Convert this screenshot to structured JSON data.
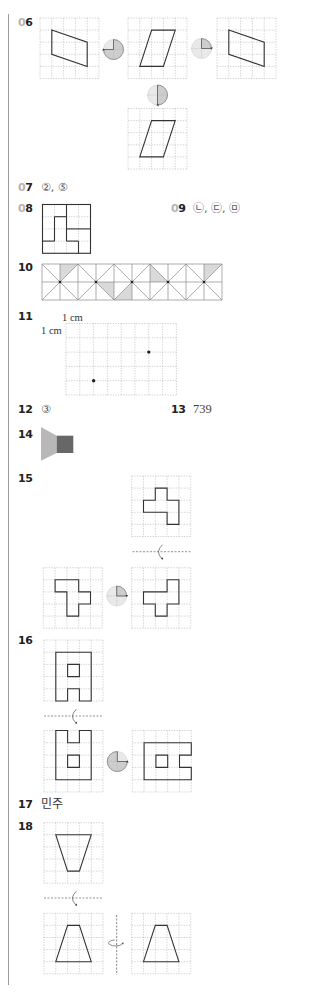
{
  "questions": {
    "q06": {
      "prefix": "0",
      "num": "6"
    },
    "q07": {
      "prefix": "0",
      "num": "7",
      "answer": "②, ⑤"
    },
    "q08": {
      "prefix": "0",
      "num": "8"
    },
    "q09": {
      "prefix": "0",
      "num": "9",
      "answer": "㉡, ㉢, ㉤"
    },
    "q10": {
      "label": "10"
    },
    "q11": {
      "label": "11",
      "unit_top": "1 cm",
      "unit_left": "1 cm"
    },
    "q12": {
      "label": "12",
      "answer": "③"
    },
    "q13": {
      "label": "13",
      "answer": "739"
    },
    "q14": {
      "label": "14"
    },
    "q15": {
      "label": "15"
    },
    "q16": {
      "label": "16"
    },
    "q17": {
      "label": "17",
      "answer": "민주"
    },
    "q18": {
      "label": "18"
    }
  },
  "colors": {
    "outline": "#333333",
    "grid_dashed": "#b3b3b3",
    "grid_solid": "#8a8a8a",
    "shade": "#d9d9d9",
    "icon_fill": "#e9e9e9",
    "icon_sector": "#cdcdcd",
    "shape_light": "#b8b8b8",
    "shape_dark": "#676767"
  },
  "figures": [
    {
      "name": "q06-figure-original",
      "type": "grid",
      "x": 40,
      "y": 18,
      "cols": 5,
      "rows": 5,
      "cw": 11.8,
      "ch": 12.1,
      "grid_style": "dashed",
      "polygons": [
        [
          [
            1,
            1
          ],
          [
            4,
            2
          ],
          [
            4,
            4
          ],
          [
            1,
            3
          ]
        ]
      ]
    },
    {
      "name": "q06-rotate-270-icon",
      "type": "rot-icon",
      "cx": 113.5,
      "cy": 49.5,
      "r": 10,
      "from": 0,
      "to": 270,
      "arrow_at": 270,
      "ccw": false
    },
    {
      "name": "q06-figure-rotated-a",
      "type": "grid",
      "x": 128,
      "y": 18,
      "cols": 5,
      "rows": 5,
      "cw": 11.8,
      "ch": 12.1,
      "grid_style": "dashed",
      "polygons": [
        [
          [
            2,
            1
          ],
          [
            4,
            1
          ],
          [
            3,
            4
          ],
          [
            1,
            4
          ]
        ]
      ]
    },
    {
      "name": "q06-rotate-90-icon",
      "type": "rot-icon",
      "cx": 201.5,
      "cy": 48.5,
      "r": 10,
      "from": 0,
      "to": 90,
      "arrow_at": 90,
      "ccw": false
    },
    {
      "name": "q06-figure-rotated-b",
      "type": "grid",
      "x": 217,
      "y": 18,
      "cols": 5,
      "rows": 5,
      "cw": 11.8,
      "ch": 12.1,
      "grid_style": "dashed",
      "polygons": [
        [
          [
            1,
            1
          ],
          [
            4,
            2
          ],
          [
            4,
            4
          ],
          [
            1,
            3
          ]
        ]
      ]
    },
    {
      "name": "q06-rotate-180-icon",
      "type": "rot-icon",
      "cx": 157.5,
      "cy": 95,
      "r": 10,
      "from": 0,
      "to": 180,
      "arrow_at": 180,
      "ccw": false
    },
    {
      "name": "q06-figure-rotated-c",
      "type": "grid",
      "x": 128,
      "y": 108.5,
      "cols": 5,
      "rows": 5,
      "cw": 11.8,
      "ch": 12.1,
      "grid_style": "dashed",
      "polygons": [
        [
          [
            2,
            1
          ],
          [
            4,
            1
          ],
          [
            3,
            4
          ],
          [
            1,
            4
          ]
        ]
      ]
    },
    {
      "name": "q08-square-puzzle",
      "type": "grid",
      "x": 42.5,
      "y": 204.5,
      "cols": 4,
      "rows": 4,
      "cw": 12,
      "ch": 12.2,
      "grid_style": "dashed",
      "border": true,
      "lines": [
        [
          2,
          0,
          2,
          3
        ],
        [
          2,
          2,
          4,
          2
        ],
        [
          2,
          3,
          3,
          3
        ],
        [
          3,
          3,
          3,
          4
        ],
        [
          1,
          1,
          2,
          1
        ],
        [
          1,
          1,
          1,
          3
        ],
        [
          0,
          3,
          1,
          3
        ]
      ]
    },
    {
      "name": "q10-triangle-pattern",
      "type": "grid",
      "x": 42,
      "y": 264,
      "cols": 10,
      "rows": 2,
      "cw": 18,
      "ch": 18,
      "grid_style": "solid",
      "shaded": [
        [
          [
            1,
            0
          ],
          [
            2,
            0
          ],
          [
            1,
            1
          ]
        ],
        [
          [
            3,
            1
          ],
          [
            4,
            1
          ],
          [
            4,
            2
          ]
        ],
        [
          [
            5,
            1
          ],
          [
            5,
            2
          ],
          [
            4,
            2
          ]
        ],
        [
          [
            6,
            0
          ],
          [
            6,
            1
          ],
          [
            7,
            1
          ]
        ],
        [
          [
            9,
            0
          ],
          [
            10,
            0
          ],
          [
            9,
            1
          ]
        ]
      ],
      "diagonals": [
        [
          0,
          0,
          1,
          1
        ],
        [
          1,
          1,
          2,
          0
        ],
        [
          1,
          1,
          0,
          2
        ],
        [
          1,
          1,
          2,
          2
        ],
        [
          2,
          0,
          3,
          1
        ],
        [
          3,
          1,
          4,
          0
        ],
        [
          3,
          1,
          2,
          2
        ],
        [
          3,
          1,
          4,
          2
        ],
        [
          4,
          0,
          5,
          1
        ],
        [
          5,
          1,
          6,
          0
        ],
        [
          5,
          1,
          4,
          2
        ],
        [
          5,
          1,
          6,
          2
        ],
        [
          6,
          0,
          7,
          1
        ],
        [
          7,
          1,
          8,
          0
        ],
        [
          7,
          1,
          6,
          2
        ],
        [
          7,
          1,
          8,
          2
        ],
        [
          8,
          0,
          9,
          1
        ],
        [
          9,
          1,
          10,
          0
        ],
        [
          9,
          1,
          8,
          2
        ],
        [
          9,
          1,
          10,
          2
        ]
      ],
      "dots": [
        [
          1,
          1
        ],
        [
          3,
          1
        ],
        [
          5,
          1
        ],
        [
          7,
          1
        ],
        [
          9,
          1
        ]
      ],
      "dot_r": 1.3
    },
    {
      "name": "q11-dot-grid",
      "type": "grid",
      "x": 66,
      "y": 323.5,
      "cols": 8,
      "rows": 5,
      "cw": 13.8,
      "ch": 14.3,
      "grid_style": "dashed",
      "dots": [
        [
          2,
          4
        ],
        [
          6,
          2
        ]
      ],
      "dot_r": 1.7
    },
    {
      "name": "q14-shape",
      "type": "shapes",
      "polys": [
        {
          "points": [
            [
              41,
              427
            ],
            [
              56.7,
              435.7
            ],
            [
              56.7,
              453
            ],
            [
              41,
              460.7
            ]
          ],
          "color": "shape_light"
        },
        {
          "points": [
            [
              56.7,
              435.7
            ],
            [
              73.3,
              435.7
            ],
            [
              73.3,
              453
            ],
            [
              56.7,
              453
            ]
          ],
          "color": "shape_dark"
        }
      ]
    },
    {
      "name": "q15-figure-top",
      "type": "grid",
      "x": 131.7,
      "y": 476,
      "cols": 5,
      "rows": 5,
      "cw": 11.8,
      "ch": 12.1,
      "grid_style": "dashed",
      "polygons": [
        [
          [
            2,
            1
          ],
          [
            3,
            1
          ],
          [
            3,
            2
          ],
          [
            4,
            2
          ],
          [
            4,
            4
          ],
          [
            3,
            4
          ],
          [
            3,
            3
          ],
          [
            1,
            3
          ],
          [
            1,
            2
          ],
          [
            2,
            2
          ]
        ]
      ]
    },
    {
      "name": "q15-flip-marker",
      "type": "flip-h",
      "x1": 132.5,
      "x2": 190.5,
      "y": 551.7,
      "ax": 160
    },
    {
      "name": "q15-figure-left",
      "type": "grid",
      "x": 43.3,
      "y": 567.7,
      "cols": 5,
      "rows": 5,
      "cw": 11.8,
      "ch": 12.1,
      "grid_style": "dashed",
      "polygons": [
        [
          [
            1,
            1
          ],
          [
            3,
            1
          ],
          [
            3,
            2
          ],
          [
            4,
            2
          ],
          [
            4,
            3
          ],
          [
            3,
            3
          ],
          [
            3,
            4
          ],
          [
            2,
            4
          ],
          [
            2,
            2
          ],
          [
            1,
            2
          ]
        ]
      ]
    },
    {
      "name": "q15-rotate-90-icon",
      "type": "rot-icon",
      "cx": 116.7,
      "cy": 596,
      "r": 10,
      "from": 0,
      "to": 90,
      "arrow_at": 90,
      "ccw": false
    },
    {
      "name": "q15-figure-right",
      "type": "grid",
      "x": 131.7,
      "y": 567.7,
      "cols": 5,
      "rows": 5,
      "cw": 11.8,
      "ch": 12.1,
      "grid_style": "dashed",
      "polygons": [
        [
          [
            1,
            2
          ],
          [
            3,
            2
          ],
          [
            3,
            1
          ],
          [
            4,
            1
          ],
          [
            4,
            3
          ],
          [
            3,
            3
          ],
          [
            3,
            4
          ],
          [
            2,
            4
          ],
          [
            2,
            3
          ],
          [
            1,
            3
          ]
        ]
      ]
    },
    {
      "name": "q16-figure-top",
      "type": "grid",
      "x": 44,
      "y": 640,
      "cols": 5,
      "rows": 5,
      "cw": 11.8,
      "ch": 12.2,
      "grid_style": "dashed",
      "polygons": [
        [
          [
            1,
            1
          ],
          [
            4,
            1
          ],
          [
            4,
            5
          ],
          [
            3,
            5
          ],
          [
            3,
            4
          ],
          [
            2,
            4
          ],
          [
            2,
            5
          ],
          [
            1,
            5
          ]
        ],
        [
          [
            2,
            2
          ],
          [
            3,
            2
          ],
          [
            3,
            3
          ],
          [
            2,
            3
          ]
        ]
      ]
    },
    {
      "name": "q16-flip-marker",
      "type": "flip-h",
      "x1": 44,
      "x2": 103,
      "y": 716,
      "ax": 74
    },
    {
      "name": "q16-figure-left",
      "type": "grid",
      "x": 44,
      "y": 730.5,
      "cols": 5,
      "rows": 5,
      "cw": 11.8,
      "ch": 12.3,
      "grid_style": "dashed",
      "polygons": [
        [
          [
            1,
            0
          ],
          [
            2,
            0
          ],
          [
            2,
            1
          ],
          [
            3,
            1
          ],
          [
            3,
            0
          ],
          [
            4,
            0
          ],
          [
            4,
            4
          ],
          [
            1,
            4
          ]
        ],
        [
          [
            2,
            2
          ],
          [
            3,
            2
          ],
          [
            3,
            3
          ],
          [
            2,
            3
          ]
        ]
      ]
    },
    {
      "name": "q16-rotate-270-icon",
      "type": "rot-icon",
      "cx": 117.3,
      "cy": 761.5,
      "r": 10,
      "from": 90,
      "to": 360,
      "arrow_at": 90,
      "ccw": true
    },
    {
      "name": "q16-figure-right",
      "type": "grid",
      "x": 132.3,
      "y": 730.5,
      "cols": 5,
      "rows": 5,
      "cw": 11.8,
      "ch": 12.3,
      "grid_style": "dashed",
      "polygons": [
        [
          [
            1,
            1
          ],
          [
            5,
            1
          ],
          [
            5,
            2
          ],
          [
            4,
            2
          ],
          [
            4,
            3
          ],
          [
            5,
            3
          ],
          [
            5,
            4
          ],
          [
            1,
            4
          ]
        ],
        [
          [
            2,
            2
          ],
          [
            3,
            2
          ],
          [
            3,
            3
          ],
          [
            2,
            3
          ]
        ]
      ]
    },
    {
      "name": "q18-figure-top",
      "type": "grid",
      "x": 44,
      "y": 822.7,
      "cols": 5,
      "rows": 5,
      "cw": 11.8,
      "ch": 12.1,
      "grid_style": "dashed",
      "polygons": [
        [
          [
            1,
            1
          ],
          [
            4,
            1
          ],
          [
            3,
            4
          ],
          [
            2,
            4
          ]
        ]
      ]
    },
    {
      "name": "q18-flip-marker",
      "type": "flip-h",
      "x1": 44,
      "x2": 103,
      "y": 898,
      "ax": 74
    },
    {
      "name": "q18-figure-left",
      "type": "grid",
      "x": 44,
      "y": 913.3,
      "cols": 5,
      "rows": 5,
      "cw": 11.8,
      "ch": 12.1,
      "grid_style": "dashed",
      "polygons": [
        [
          [
            2,
            1
          ],
          [
            3,
            1
          ],
          [
            4,
            4
          ],
          [
            1,
            4
          ]
        ]
      ]
    },
    {
      "name": "q18-vertical-flip-marker",
      "type": "flip-v",
      "x": 116.7,
      "y1": 915,
      "y2": 975,
      "ay": 943
    },
    {
      "name": "q18-figure-right",
      "type": "grid",
      "x": 131.7,
      "y": 913.3,
      "cols": 5,
      "rows": 5,
      "cw": 11.8,
      "ch": 12.1,
      "grid_style": "dashed",
      "polygons": [
        [
          [
            2,
            1
          ],
          [
            3,
            1
          ],
          [
            4,
            4
          ],
          [
            1,
            4
          ]
        ]
      ]
    }
  ]
}
